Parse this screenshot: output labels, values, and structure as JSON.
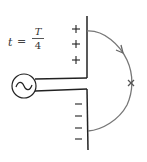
{
  "diagram": {
    "type": "dipole-antenna-field-line",
    "time_label": {
      "variable": "t",
      "equals": "=",
      "numerator": "T",
      "denominator": "4"
    },
    "source": {
      "symbol": "~",
      "name": "AC source"
    },
    "upper_plate_charges": [
      "+",
      "+",
      "+"
    ],
    "lower_plate_charges": [
      "−",
      "−",
      "−",
      "−"
    ],
    "field_line": {
      "has_arrow": true,
      "marker": "×"
    },
    "colors": {
      "ink": "#222222",
      "field_line": "#777777",
      "background": "#ffffff"
    }
  }
}
